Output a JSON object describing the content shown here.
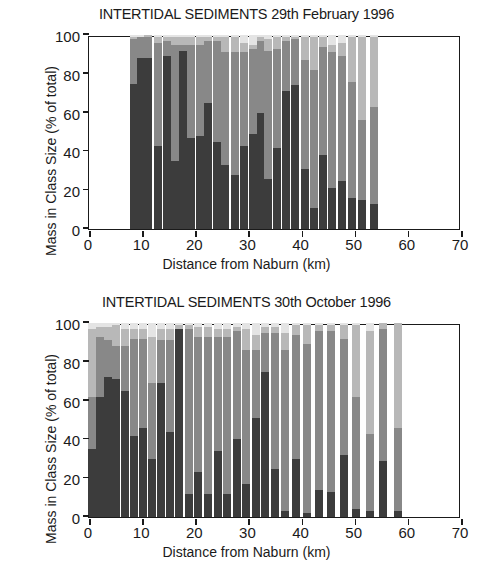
{
  "figure": {
    "axis_title_x": "Distance from Naburn (km)",
    "axis_title_y": "Mass in Class Size (% of total)",
    "caption": ""
  },
  "colors": {
    "class1": "#3c3c3c",
    "class2": "#888888",
    "class3": "#b8b8b8",
    "class4": "#e4e4e4",
    "axis": "#1a1a1a",
    "background": "#ffffff"
  },
  "chart_data": [
    {
      "type": "bar",
      "stacked": true,
      "title": "INTERTIDAL SEDIMENTS 29th February 1996",
      "xlabel": "Distance from Naburn (km)",
      "ylabel": "Mass in Class Size (% of total)",
      "xlim": [
        0,
        70
      ],
      "ylim": [
        0,
        100
      ],
      "xticks": [
        0,
        10,
        20,
        30,
        40,
        50,
        60,
        70
      ],
      "yticks": [
        0,
        20,
        40,
        60,
        80,
        100
      ],
      "grid": false,
      "legend": "none",
      "series": [
        {
          "name": "Class 1 (coarse)",
          "shade": "#3c3c3c"
        },
        {
          "name": "Class 2",
          "shade": "#888888"
        },
        {
          "name": "Class 3",
          "shade": "#b8b8b8"
        },
        {
          "name": "Class 4 (fine)",
          "shade": "#e4e4e4"
        }
      ],
      "x": [
        8.4,
        9.8,
        11.1,
        13.0,
        14.6,
        16.1,
        17.6,
        19.2,
        20.8,
        22.4,
        24.0,
        25.6,
        27.4,
        29.2,
        30.8,
        32.3,
        33.7,
        35.3,
        37.0,
        38.8,
        40.6,
        42.3,
        44.0,
        45.8,
        47.6,
        49.4,
        51.4,
        53.6,
        55.9,
        58.3,
        60.7,
        63.2,
        65.8
      ],
      "bar_width": 1.5,
      "values": [
        [
          75,
          23,
          1,
          1
        ],
        [
          88,
          11,
          0,
          1
        ],
        [
          88,
          11,
          1,
          0
        ],
        [
          43,
          53,
          3,
          1
        ],
        [
          89,
          8,
          2,
          1
        ],
        [
          35,
          60,
          4,
          1
        ],
        [
          92,
          3,
          4,
          1
        ],
        [
          47,
          48,
          4,
          1
        ],
        [
          48,
          47,
          4,
          1
        ],
        [
          65,
          32,
          2,
          1
        ],
        [
          45,
          52,
          2,
          1
        ],
        [
          33,
          58,
          8,
          1
        ],
        [
          28,
          63,
          8,
          1
        ],
        [
          43,
          48,
          5,
          4
        ],
        [
          49,
          44,
          2,
          5
        ],
        [
          60,
          37,
          2,
          1
        ],
        [
          26,
          66,
          6,
          2
        ],
        [
          42,
          51,
          6,
          1
        ],
        [
          71,
          26,
          2,
          1
        ],
        [
          74,
          24,
          1,
          1
        ],
        [
          31,
          56,
          12,
          1
        ],
        [
          11,
          71,
          17,
          1
        ],
        [
          38,
          56,
          5,
          1
        ],
        [
          21,
          70,
          4,
          5
        ],
        [
          25,
          64,
          7,
          4
        ],
        [
          16,
          60,
          23,
          1
        ],
        [
          15,
          41,
          43,
          1
        ],
        [
          13,
          50,
          36,
          1
        ]
      ]
    },
    {
      "type": "bar",
      "stacked": true,
      "title": "INTERTIDAL SEDIMENTS 30th October 1996",
      "xlabel": "Distance from Naburn (km)",
      "ylabel": "Mass in Class Size (% of total)",
      "xlim": [
        0,
        70
      ],
      "ylim": [
        0,
        100
      ],
      "xticks": [
        0,
        10,
        20,
        30,
        40,
        50,
        60,
        70
      ],
      "yticks": [
        0,
        20,
        40,
        60,
        80,
        100
      ],
      "grid": false,
      "legend": "none",
      "series": [
        {
          "name": "Class 1 (coarse)",
          "shade": "#3c3c3c"
        },
        {
          "name": "Class 2",
          "shade": "#888888"
        },
        {
          "name": "Class 3",
          "shade": "#b8b8b8"
        },
        {
          "name": "Class 4 (fine)",
          "shade": "#e4e4e4"
        }
      ],
      "x": [
        0.6,
        2.0,
        3.5,
        5.1,
        6.8,
        8.5,
        10.2,
        11.9,
        13.6,
        15.3,
        17.0,
        18.8,
        20.6,
        22.4,
        24.2,
        26.0,
        27.8,
        29.6,
        31.4,
        33.2,
        35.0,
        36.9,
        38.9,
        41.0,
        43.2,
        45.5,
        47.9,
        50.3,
        52.8,
        55.4,
        58.1,
        60.9,
        63.8,
        66.5
      ],
      "bar_width": 1.5,
      "values": [
        [
          35,
          27,
          35,
          3
        ],
        [
          62,
          31,
          5,
          2
        ],
        [
          72,
          19,
          7,
          2
        ],
        [
          71,
          17,
          11,
          1
        ],
        [
          65,
          23,
          9,
          3
        ],
        [
          42,
          50,
          5,
          3
        ],
        [
          46,
          46,
          5,
          3
        ],
        [
          30,
          39,
          24,
          7
        ],
        [
          69,
          22,
          6,
          3
        ],
        [
          44,
          47,
          6,
          3
        ],
        [
          97,
          0,
          2,
          1
        ],
        [
          12,
          85,
          2,
          1
        ],
        [
          23,
          70,
          5,
          2
        ],
        [
          12,
          81,
          5,
          2
        ],
        [
          34,
          59,
          4,
          3
        ],
        [
          12,
          81,
          4,
          3
        ],
        [
          40,
          56,
          2,
          2
        ],
        [
          17,
          69,
          11,
          3
        ],
        [
          51,
          35,
          8,
          6
        ],
        [
          75,
          20,
          3,
          2
        ],
        [
          25,
          70,
          3,
          2
        ],
        [
          3,
          83,
          9,
          5
        ],
        [
          30,
          64,
          5,
          1
        ],
        [
          2,
          87,
          10,
          1
        ],
        [
          14,
          82,
          3,
          1
        ],
        [
          13,
          83,
          3,
          1
        ],
        [
          32,
          60,
          7,
          1
        ],
        [
          4,
          58,
          37,
          1
        ],
        [
          3,
          40,
          53,
          4
        ],
        [
          29,
          68,
          3,
          0
        ],
        [
          3,
          43,
          54,
          0
        ]
      ]
    }
  ]
}
